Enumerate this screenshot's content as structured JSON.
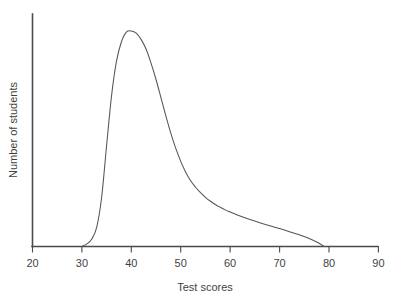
{
  "figure": {
    "width": 402,
    "height": 302,
    "background_color": "#ffffff"
  },
  "chart_data": {
    "type": "line",
    "title": "",
    "subtitle": "",
    "xlabel": "Test scores",
    "ylabel": "Number of students",
    "xlim": [
      20,
      90
    ],
    "ylim": [
      0,
      1.0
    ],
    "grid": false,
    "legend": false,
    "legend_position": "none",
    "x_ticks": [
      20,
      30,
      40,
      50,
      60,
      70,
      80,
      90
    ],
    "x_tick_labels": [
      "20",
      "30",
      "40",
      "50",
      "60",
      "70",
      "80",
      "90"
    ],
    "y_ticks": [],
    "y_tick_labels": [],
    "annotations": [],
    "series": [
      {
        "name": "Number of students",
        "color": "#555555",
        "line_width": 1.05,
        "x": [
          30,
          31,
          32,
          33,
          34,
          35,
          36,
          37,
          38,
          39,
          40,
          41,
          42,
          43,
          44,
          45,
          46,
          47,
          48,
          49,
          50,
          51,
          52,
          53,
          54,
          55,
          56,
          57,
          58,
          59,
          60,
          62,
          64,
          66,
          68,
          70,
          72,
          74,
          76,
          78,
          79
        ],
        "y": [
          0.0,
          0.012,
          0.035,
          0.09,
          0.23,
          0.47,
          0.7,
          0.86,
          0.95,
          0.995,
          1.0,
          0.99,
          0.96,
          0.915,
          0.85,
          0.775,
          0.69,
          0.605,
          0.525,
          0.455,
          0.395,
          0.345,
          0.305,
          0.275,
          0.25,
          0.228,
          0.21,
          0.195,
          0.182,
          0.17,
          0.16,
          0.141,
          0.125,
          0.11,
          0.096,
          0.083,
          0.069,
          0.054,
          0.037,
          0.015,
          0.0
        ]
      }
    ]
  },
  "axes": {
    "line_color": "#4a4a4a",
    "y_axis_visible": true,
    "x_axis_visible": true
  }
}
